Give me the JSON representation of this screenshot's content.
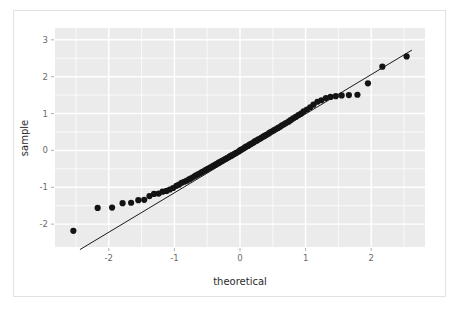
{
  "figure": {
    "background_color": "#ffffff",
    "border_color": "#e2e2e2",
    "panel_color": "#ebebeb",
    "gridline_color": "#ffffff",
    "point_color": "#131313",
    "line_color": "#1a1a1a"
  },
  "chart_data": {
    "type": "scatter",
    "title": "",
    "subtitle": "",
    "xlabel": "theoretical",
    "ylabel": "sample",
    "xlim": [
      -2.82,
      2.82
    ],
    "ylim": [
      -2.62,
      3.32
    ],
    "xticks": [
      -2,
      -1,
      0,
      1,
      2
    ],
    "xticklabels": [
      "-2",
      "-1",
      "0",
      "1",
      "2"
    ],
    "yticks": [
      -2,
      -1,
      0,
      1,
      2,
      3
    ],
    "yticklabels": [
      "-2",
      "-1",
      "0",
      "1",
      "2",
      "3"
    ],
    "x_minor_ticks": [
      -2.5,
      -1.5,
      -0.5,
      0.5,
      1.5,
      2.5
    ],
    "y_minor_ticks": [
      -1.5,
      -0.5,
      0.5,
      1.5,
      2.5
    ],
    "grid": true,
    "legend": null,
    "reference_line": {
      "name": "qq-reference-line",
      "x": [
        -2.44,
        2.62
      ],
      "y": [
        -2.69,
        2.72
      ]
    },
    "series": [
      {
        "name": "sample quantiles",
        "marker": "circle",
        "marker_size": 3.1,
        "x": [
          -2.54,
          -2.17,
          -1.95,
          -1.79,
          -1.66,
          -1.55,
          -1.46,
          -1.38,
          -1.31,
          -1.24,
          -1.18,
          -1.12,
          -1.07,
          -1.02,
          -0.97,
          -0.93,
          -0.89,
          -0.85,
          -0.81,
          -0.77,
          -0.74,
          -0.7,
          -0.67,
          -0.64,
          -0.61,
          -0.58,
          -0.55,
          -0.52,
          -0.49,
          -0.46,
          -0.44,
          -0.41,
          -0.38,
          -0.36,
          -0.33,
          -0.31,
          -0.28,
          -0.26,
          -0.23,
          -0.21,
          -0.19,
          -0.16,
          -0.14,
          -0.12,
          -0.09,
          -0.07,
          -0.05,
          -0.02,
          0.0,
          0.02,
          0.05,
          0.07,
          0.09,
          0.12,
          0.14,
          0.16,
          0.19,
          0.21,
          0.23,
          0.26,
          0.28,
          0.31,
          0.33,
          0.36,
          0.38,
          0.41,
          0.44,
          0.46,
          0.49,
          0.52,
          0.55,
          0.58,
          0.61,
          0.64,
          0.67,
          0.7,
          0.74,
          0.77,
          0.81,
          0.85,
          0.89,
          0.93,
          0.97,
          1.02,
          1.07,
          1.12,
          1.18,
          1.24,
          1.31,
          1.38,
          1.46,
          1.55,
          1.66,
          1.79,
          1.95,
          2.17,
          2.54
        ],
        "y": [
          -2.18,
          -1.56,
          -1.55,
          -1.43,
          -1.42,
          -1.35,
          -1.34,
          -1.24,
          -1.18,
          -1.17,
          -1.12,
          -1.1,
          -1.06,
          -1.02,
          -0.96,
          -0.93,
          -0.88,
          -0.85,
          -0.82,
          -0.78,
          -0.75,
          -0.71,
          -0.68,
          -0.65,
          -0.62,
          -0.59,
          -0.56,
          -0.53,
          -0.5,
          -0.47,
          -0.45,
          -0.42,
          -0.39,
          -0.37,
          -0.34,
          -0.32,
          -0.29,
          -0.27,
          -0.24,
          -0.22,
          -0.2,
          -0.17,
          -0.15,
          -0.13,
          -0.1,
          -0.08,
          -0.06,
          -0.03,
          0.0,
          0.02,
          0.05,
          0.07,
          0.1,
          0.12,
          0.15,
          0.17,
          0.2,
          0.22,
          0.25,
          0.27,
          0.3,
          0.32,
          0.35,
          0.38,
          0.4,
          0.43,
          0.46,
          0.49,
          0.52,
          0.55,
          0.58,
          0.61,
          0.64,
          0.68,
          0.71,
          0.74,
          0.78,
          0.82,
          0.87,
          0.91,
          0.96,
          1.0,
          1.06,
          1.11,
          1.17,
          1.24,
          1.32,
          1.36,
          1.42,
          1.45,
          1.47,
          1.49,
          1.5,
          1.51,
          1.82,
          2.27,
          2.55
        ]
      }
    ]
  },
  "axis": {
    "x_title": "theoretical",
    "y_title": "sample"
  }
}
